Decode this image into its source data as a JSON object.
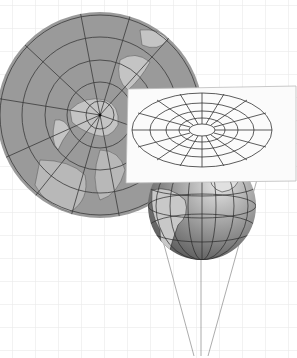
{
  "diagram": {
    "type": "azimuthal-map-projection-illustration",
    "elements": [
      {
        "name": "background-grid",
        "description": "light gray square grid"
      },
      {
        "name": "polar-azimuthal-map",
        "description": "gray circular map centered on North Pole with meridians and parallels"
      },
      {
        "name": "projection-plane",
        "description": "white tilted sheet with elliptical graticule (concentric ellipses and radial lines)"
      },
      {
        "name": "globe",
        "description": "shaded globe showing the Americas with graticule"
      },
      {
        "name": "projection-rays",
        "description": "three lines converging from the globe/plane to a point below"
      }
    ],
    "labels": []
  },
  "colors": {
    "grid": "#e6e6e6",
    "map_ocean": "#9a9a9a",
    "map_land": "#c4c4c4",
    "graticule": "#3a3a3a",
    "paper": "#fbfbfb",
    "globe_dark": "#6e6e6e",
    "globe_light": "#d8d8d8"
  }
}
